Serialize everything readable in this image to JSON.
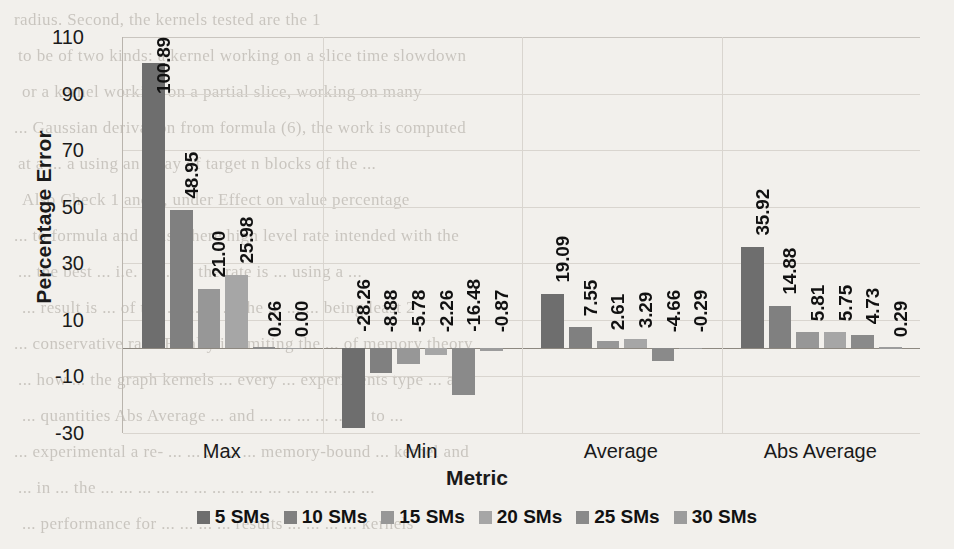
{
  "chart_data": {
    "type": "bar",
    "title": "",
    "xlabel": "Metric",
    "ylabel": "Percentage Error",
    "categories": [
      "Max",
      "Min",
      "Average",
      "Abs Average"
    ],
    "yticks": [
      110,
      90,
      70,
      50,
      30,
      10,
      -10,
      -30
    ],
    "ylim": [
      -30,
      110
    ],
    "grid": true,
    "legend_position": "bottom",
    "series": [
      {
        "name": "5 SMs",
        "color": "#6e6e6e",
        "values": [
          100.89,
          -28.26,
          19.09,
          35.92
        ],
        "labels": [
          "100.89",
          "-28.26",
          "19.09",
          "35.92"
        ]
      },
      {
        "name": "10 SMs",
        "color": "#808080",
        "values": [
          48.95,
          -8.88,
          7.55,
          14.88
        ],
        "labels": [
          "48.95",
          "-8.88",
          "7.55",
          "14.88"
        ]
      },
      {
        "name": "15 SMs",
        "color": "#979797",
        "values": [
          21.0,
          -5.78,
          2.61,
          5.81
        ],
        "labels": [
          "21.00",
          "-5.78",
          "2.61",
          "5.81"
        ]
      },
      {
        "name": "20 SMs",
        "color": "#a6a6a6",
        "values": [
          25.98,
          -2.26,
          3.29,
          5.75
        ],
        "labels": [
          "25.98",
          "-2.26",
          "3.29",
          "5.75"
        ]
      },
      {
        "name": "25 SMs",
        "color": "#8a8a8a",
        "values": [
          0.26,
          -16.48,
          -4.66,
          4.73
        ],
        "labels": [
          "0.26",
          "-16.48",
          "-4.66",
          "4.73"
        ]
      },
      {
        "name": "30 SMs",
        "color": "#9c9c9c",
        "values": [
          0.0,
          -0.87,
          -0.29,
          0.29
        ],
        "labels": [
          "0.00",
          "-0.87",
          "-0.29",
          "0.29"
        ]
      }
    ]
  },
  "scan_background": {
    "lines": [
      "radius. Second, the kernels tested are the 1",
      "to be of two kinds: a kernel working on a slice time slowdown",
      "or a kernel working on a partial slice, working on many",
      "... Gaussian derivation from formula (6), the work is computed",
      "at  a  ...  a  using  an  array of target  n  blocks of the  ...",
      "Also Check 1 and 2, under Effect on value percentage",
      "... to  formula and  ... is where high level rate intended with the",
      "...  the  best  ...  i.e.  ...  ...  ...  the  rate  is  ...  using  a  ...",
      "... result is  ...  of the  ...  ...  ...  ...  the  ...  ...  ... being least  2",
      "... conservative  rate.  Finally  is  limiting  the  ...  of  memory  theory",
      "... how  ...  the  graph  kernels  ...  every  ...  experiments  type  ...  and",
      "...  quantities  Abs  Average  ...  and  ...  ...  ...  ...  ...  ...  to  ...",
      "... experimental a  re-  ...  ...  ...  ...  ...  memory-bound  ...  kernel  and",
      "... in  ...  the  ...  ...  ...  ...  ...  ...  ...  ...  ...  ...  ...  ...  ...  ...  ...",
      "... performance  for  ...  ...  ...  ...  results  ...  ...  ...  ...  kernels"
    ]
  }
}
